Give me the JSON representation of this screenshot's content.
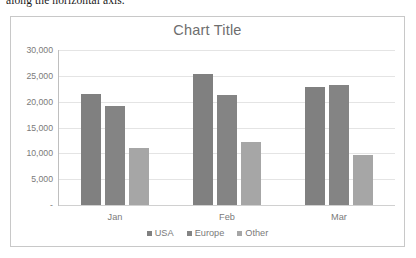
{
  "document": {
    "clipped_text_above_chart": "along the horizontal axis."
  },
  "chart_data": {
    "type": "bar",
    "title": "Chart Title",
    "xlabel": "",
    "ylabel": "",
    "categories": [
      "Jan",
      "Feb",
      "Mar"
    ],
    "series": [
      {
        "name": "USA",
        "color": "#808080",
        "values": [
          21500,
          25400,
          22800
        ]
      },
      {
        "name": "Europe",
        "color": "#848484",
        "values": [
          19200,
          21200,
          23300
        ]
      },
      {
        "name": "Other",
        "color": "#a6a6a6",
        "values": [
          11000,
          12200,
          9700
        ]
      }
    ],
    "ylim": [
      0,
      30000
    ],
    "ytick_values": [
      30000,
      25000,
      20000,
      15000,
      10000,
      5000,
      0
    ],
    "ytick_labels": [
      "30,000",
      "25,000",
      "20,000",
      "15,000",
      "10,000",
      "5,000",
      "-"
    ],
    "grid": true,
    "legend_position": "bottom",
    "plot_background": "#ffffff",
    "gridline_color": "#e4e4e4",
    "axis_color": "#bfbfbf",
    "text_color": "#7a7a7a",
    "frame_border_color": "#c8c8c8"
  }
}
